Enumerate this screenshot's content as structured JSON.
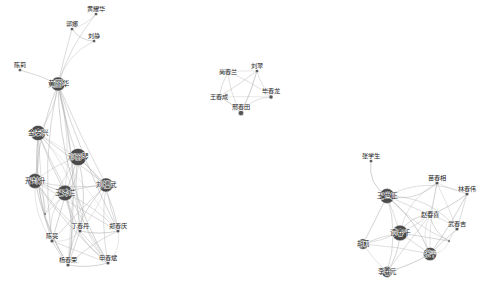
{
  "figure": {
    "title": "",
    "background_color": "#ffffff",
    "width": 489,
    "height": 292
  },
  "chart_data": {
    "type": "scatter",
    "subtype": "force-directed-network-graph",
    "title": "",
    "xlabel": "",
    "ylabel": "",
    "grid": false,
    "legend": null,
    "xlim": [
      0,
      489
    ],
    "ylim": [
      0,
      292
    ],
    "node_color": "#4a4a4a",
    "node_color_small": "#555555",
    "edge_color": "#b0b0b0",
    "label_color": "#1a1a1a",
    "clusters": [
      {
        "id": "cluster-left",
        "label": "",
        "node_count": 16
      },
      {
        "id": "cluster-middle",
        "label": "",
        "node_count": 5
      },
      {
        "id": "cluster-right",
        "label": "",
        "node_count": 11
      }
    ],
    "nodes": [
      {
        "id": "n0",
        "label": "黄耀华",
        "x": 96,
        "y": 14,
        "r": 1.6,
        "cluster": "cluster-left",
        "font": 6.2
      },
      {
        "id": "n1",
        "label": "郭娜",
        "x": 72,
        "y": 29,
        "r": 1.6,
        "cluster": "cluster-left",
        "font": 6.0
      },
      {
        "id": "n2",
        "label": "刘静",
        "x": 94,
        "y": 41,
        "r": 1.6,
        "cluster": "cluster-left",
        "font": 6.0
      },
      {
        "id": "n3",
        "label": "陈莉",
        "x": 20,
        "y": 70,
        "r": 1.6,
        "cluster": "cluster-left",
        "font": 6.0
      },
      {
        "id": "n4",
        "label": "黄丽华",
        "x": 58,
        "y": 84,
        "r": 7.0,
        "cluster": "cluster-left",
        "font": 7.4
      },
      {
        "id": "n5",
        "label": "金泰兴",
        "x": 38,
        "y": 133,
        "r": 7.6,
        "cluster": "cluster-left",
        "font": 6.6
      },
      {
        "id": "n6",
        "label": "邓丽琴",
        "x": 78,
        "y": 157,
        "r": 8.6,
        "cluster": "cluster-left",
        "font": 6.6
      },
      {
        "id": "n7",
        "label": "开封升",
        "x": 35,
        "y": 181,
        "r": 7.4,
        "cluster": "cluster-left",
        "font": 6.6
      },
      {
        "id": "n8",
        "label": "刘福武",
        "x": 106,
        "y": 185,
        "r": 7.0,
        "cluster": "cluster-left",
        "font": 6.6
      },
      {
        "id": "n9",
        "label": "王秀兰",
        "x": 65,
        "y": 193,
        "r": 7.8,
        "cluster": "cluster-left",
        "font": 6.6
      },
      {
        "id": "n10",
        "label": "丁春丹",
        "x": 80,
        "y": 231,
        "r": 1.8,
        "cluster": "cluster-left",
        "font": 6.2
      },
      {
        "id": "n11",
        "label": "郑春庆",
        "x": 118,
        "y": 231,
        "r": 1.8,
        "cluster": "cluster-left",
        "font": 6.2
      },
      {
        "id": "n12",
        "label": "陈亮",
        "x": 52,
        "y": 241,
        "r": 1.8,
        "cluster": "cluster-left",
        "font": 6.2
      },
      {
        "id": "n13",
        "label": "杨春荣",
        "x": 68,
        "y": 265,
        "r": 1.8,
        "cluster": "cluster-left",
        "font": 6.2
      },
      {
        "id": "n14",
        "label": "申春斌",
        "x": 108,
        "y": 263,
        "r": 1.8,
        "cluster": "cluster-left",
        "font": 6.2
      },
      {
        "id": "n15",
        "label": "",
        "x": 45,
        "y": 214,
        "r": 1.2,
        "cluster": "cluster-left",
        "font": 5.6
      },
      {
        "id": "m0",
        "label": "尚春兰",
        "x": 228,
        "y": 72,
        "r": 3.2,
        "cluster": "cluster-middle",
        "font": 6.2
      },
      {
        "id": "m1",
        "label": "刘翠",
        "x": 257,
        "y": 71,
        "r": 1.6,
        "cluster": "cluster-middle",
        "font": 6.2
      },
      {
        "id": "m2",
        "label": "王春成",
        "x": 219,
        "y": 97,
        "r": 3.0,
        "cluster": "cluster-middle",
        "font": 6.2
      },
      {
        "id": "m3",
        "label": "毕春龙",
        "x": 271,
        "y": 97,
        "r": 2.0,
        "cluster": "cluster-middle",
        "font": 6.2
      },
      {
        "id": "m4",
        "label": "邢春田",
        "x": 241,
        "y": 113,
        "r": 2.6,
        "cluster": "cluster-middle",
        "font": 6.2
      },
      {
        "id": "r0",
        "label": "张学生",
        "x": 371,
        "y": 161,
        "r": 1.6,
        "cluster": "cluster-right",
        "font": 6.2
      },
      {
        "id": "r1",
        "label": "王世正",
        "x": 387,
        "y": 196,
        "r": 7.4,
        "cluster": "cluster-right",
        "font": 6.8
      },
      {
        "id": "r2",
        "label": "苗春相",
        "x": 437,
        "y": 183,
        "r": 1.8,
        "cluster": "cluster-right",
        "font": 6.2
      },
      {
        "id": "r3",
        "label": "林春伟",
        "x": 467,
        "y": 194,
        "r": 1.8,
        "cluster": "cluster-right",
        "font": 6.2
      },
      {
        "id": "r4",
        "label": "赵春喜",
        "x": 430,
        "y": 215,
        "r": 3.0,
        "cluster": "cluster-right",
        "font": 6.4
      },
      {
        "id": "r5",
        "label": "武春吉",
        "x": 457,
        "y": 229,
        "r": 1.8,
        "cluster": "cluster-right",
        "font": 6.2
      },
      {
        "id": "r6",
        "label": "谭春千",
        "x": 400,
        "y": 233,
        "r": 7.8,
        "cluster": "cluster-right",
        "font": 6.6
      },
      {
        "id": "r7",
        "label": "胡莉",
        "x": 363,
        "y": 244,
        "r": 5.2,
        "cluster": "cluster-right",
        "font": 6.4
      },
      {
        "id": "r8",
        "label": "张平",
        "x": 430,
        "y": 254,
        "r": 6.6,
        "cluster": "cluster-right",
        "font": 6.4
      },
      {
        "id": "r9",
        "label": "李春元",
        "x": 387,
        "y": 272,
        "r": 5.4,
        "cluster": "cluster-right",
        "font": 6.4
      },
      {
        "id": "r10",
        "label": "",
        "x": 449,
        "y": 241,
        "r": 1.2,
        "cluster": "cluster-right",
        "font": 5.6
      }
    ],
    "edges": [
      [
        "n4",
        "n0"
      ],
      [
        "n4",
        "n1"
      ],
      [
        "n4",
        "n2"
      ],
      [
        "n4",
        "n3"
      ],
      [
        "n0",
        "n1"
      ],
      [
        "n1",
        "n2"
      ],
      [
        "n4",
        "n5"
      ],
      [
        "n4",
        "n6"
      ],
      [
        "n4",
        "n7"
      ],
      [
        "n4",
        "n8"
      ],
      [
        "n4",
        "n9"
      ],
      [
        "n4",
        "n10"
      ],
      [
        "n4",
        "n11"
      ],
      [
        "n4",
        "n12"
      ],
      [
        "n4",
        "n13"
      ],
      [
        "n4",
        "n14"
      ],
      [
        "n5",
        "n6"
      ],
      [
        "n5",
        "n7"
      ],
      [
        "n5",
        "n8"
      ],
      [
        "n5",
        "n9"
      ],
      [
        "n5",
        "n10"
      ],
      [
        "n5",
        "n11"
      ],
      [
        "n5",
        "n12"
      ],
      [
        "n5",
        "n13"
      ],
      [
        "n5",
        "n14"
      ],
      [
        "n5",
        "n15"
      ],
      [
        "n6",
        "n7"
      ],
      [
        "n6",
        "n8"
      ],
      [
        "n6",
        "n9"
      ],
      [
        "n6",
        "n10"
      ],
      [
        "n6",
        "n11"
      ],
      [
        "n6",
        "n12"
      ],
      [
        "n6",
        "n13"
      ],
      [
        "n6",
        "n14"
      ],
      [
        "n6",
        "n15"
      ],
      [
        "n7",
        "n8"
      ],
      [
        "n7",
        "n9"
      ],
      [
        "n7",
        "n10"
      ],
      [
        "n7",
        "n11"
      ],
      [
        "n7",
        "n12"
      ],
      [
        "n7",
        "n13"
      ],
      [
        "n7",
        "n14"
      ],
      [
        "n7",
        "n15"
      ],
      [
        "n8",
        "n9"
      ],
      [
        "n8",
        "n10"
      ],
      [
        "n8",
        "n11"
      ],
      [
        "n8",
        "n12"
      ],
      [
        "n8",
        "n13"
      ],
      [
        "n8",
        "n14"
      ],
      [
        "n9",
        "n10"
      ],
      [
        "n9",
        "n11"
      ],
      [
        "n9",
        "n12"
      ],
      [
        "n9",
        "n13"
      ],
      [
        "n9",
        "n14"
      ],
      [
        "n9",
        "n15"
      ],
      [
        "n10",
        "n11"
      ],
      [
        "n10",
        "n12"
      ],
      [
        "n10",
        "n13"
      ],
      [
        "n10",
        "n14"
      ],
      [
        "n11",
        "n13"
      ],
      [
        "n11",
        "n14"
      ],
      [
        "n12",
        "n13"
      ],
      [
        "n12",
        "n14"
      ],
      [
        "n13",
        "n14"
      ],
      [
        "m0",
        "m1"
      ],
      [
        "m0",
        "m2"
      ],
      [
        "m0",
        "m3"
      ],
      [
        "m0",
        "m4"
      ],
      [
        "m1",
        "m2"
      ],
      [
        "m1",
        "m3"
      ],
      [
        "m1",
        "m4"
      ],
      [
        "m2",
        "m3"
      ],
      [
        "m2",
        "m4"
      ],
      [
        "m3",
        "m4"
      ],
      [
        "r1",
        "r0"
      ],
      [
        "r1",
        "r2"
      ],
      [
        "r1",
        "r3"
      ],
      [
        "r1",
        "r4"
      ],
      [
        "r1",
        "r5"
      ],
      [
        "r1",
        "r6"
      ],
      [
        "r1",
        "r7"
      ],
      [
        "r1",
        "r8"
      ],
      [
        "r1",
        "r9"
      ],
      [
        "r1",
        "r10"
      ],
      [
        "r2",
        "r3"
      ],
      [
        "r2",
        "r4"
      ],
      [
        "r2",
        "r5"
      ],
      [
        "r2",
        "r6"
      ],
      [
        "r2",
        "r8"
      ],
      [
        "r3",
        "r4"
      ],
      [
        "r3",
        "r5"
      ],
      [
        "r3",
        "r8"
      ],
      [
        "r4",
        "r5"
      ],
      [
        "r4",
        "r6"
      ],
      [
        "r4",
        "r7"
      ],
      [
        "r4",
        "r8"
      ],
      [
        "r4",
        "r9"
      ],
      [
        "r4",
        "r10"
      ],
      [
        "r5",
        "r8"
      ],
      [
        "r5",
        "r10"
      ],
      [
        "r6",
        "r7"
      ],
      [
        "r6",
        "r8"
      ],
      [
        "r6",
        "r9"
      ],
      [
        "r6",
        "r10"
      ],
      [
        "r7",
        "r8"
      ],
      [
        "r7",
        "r9"
      ],
      [
        "r8",
        "r9"
      ],
      [
        "r8",
        "r10"
      ]
    ]
  }
}
